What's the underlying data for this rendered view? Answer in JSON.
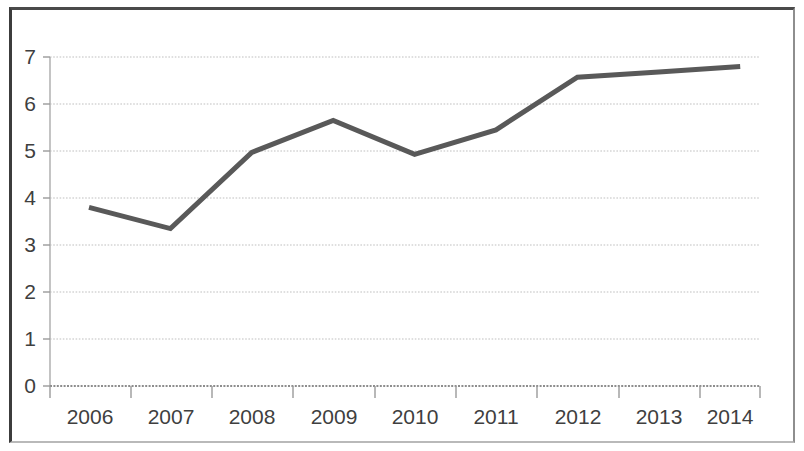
{
  "chart_data": {
    "type": "line",
    "title": "",
    "subtitle": "",
    "xlabel": "",
    "ylabel": "",
    "categories": [
      "2006",
      "2007",
      "2008",
      "2009",
      "2010",
      "2011",
      "2012",
      "2013",
      "2014"
    ],
    "series": [
      {
        "name": "Series 1",
        "values": [
          3.8,
          3.35,
          4.97,
          5.65,
          4.93,
          5.45,
          6.57,
          6.68,
          6.8
        ],
        "color": "#595959",
        "line_width": 5,
        "markers": false
      }
    ],
    "ylim": [
      0,
      7
    ],
    "ytick_labels": [
      "0",
      "1",
      "2",
      "3",
      "4",
      "5",
      "6",
      "7"
    ],
    "ytick_values": [
      0,
      1,
      2,
      3,
      4,
      5,
      6,
      7
    ],
    "xtick_labels": [
      "2006",
      "2007",
      "2008",
      "2009",
      "2010",
      "2011",
      "2012",
      "2013",
      "2014"
    ],
    "grid": {
      "horizontal": true,
      "vertical": false,
      "style": "dotted",
      "color": "#bfbfbf"
    },
    "legend": {
      "visible": false,
      "position": "none",
      "entries": []
    },
    "axis": {
      "y_axis_line_color": "#b0b0b0",
      "x_axis_line_color": "#a6a6a6",
      "tick_marks": true
    },
    "annotations": [],
    "colors": {
      "background": "#ffffff",
      "plot_line": "#595959",
      "text": "#3f3f3f",
      "gridline": "#bfbfbf",
      "frame": "#3c3c3c"
    }
  }
}
